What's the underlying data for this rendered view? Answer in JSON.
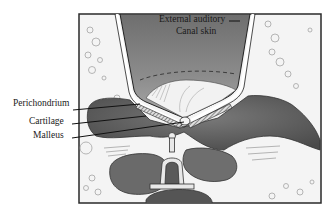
{
  "figure": {
    "type": "anatomical-illustration",
    "labels": {
      "external_auditory_line1": "External auditory",
      "external_auditory_line2": "Canal skin",
      "perichondrium": "Perichondrium",
      "cartilage": "Cartilage",
      "malleus": "Malleus"
    },
    "colors": {
      "background": "#ffffff",
      "frame": "#2a2a2a",
      "tissue_dark": "#5a5a5a",
      "tissue_mid": "#8a8a8a",
      "canal_fill": "#7c7c7c",
      "membrane": "#f2f2f2",
      "bone": "#e8e8e8"
    }
  }
}
